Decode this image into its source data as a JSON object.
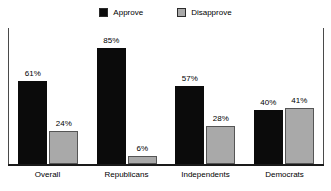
{
  "chart_data": {
    "type": "bar",
    "title": "",
    "subtitle": "",
    "xlabel": "",
    "ylabel": "",
    "ylim": [
      0,
      100
    ],
    "grid": false,
    "legend_position": "top-center",
    "value_suffix": "%",
    "categories": [
      "Overall",
      "Republicans",
      "Independents",
      "Democrats"
    ],
    "series": [
      {
        "name": "Approve",
        "color": "#0b0b0b",
        "values": [
          61,
          85,
          57,
          40
        ],
        "labels": [
          "61%",
          "85%",
          "57%",
          "40%"
        ]
      },
      {
        "name": "Disapprove",
        "color": "#a9a9a9",
        "values": [
          24,
          6,
          28,
          41
        ],
        "labels": [
          "24%",
          "6%",
          "28%",
          "41%"
        ]
      }
    ]
  },
  "legend": {
    "entries": [
      {
        "label": "Approve",
        "color": "#0b0b0b"
      },
      {
        "label": "Disapprove",
        "color": "#a9a9a9"
      }
    ]
  }
}
